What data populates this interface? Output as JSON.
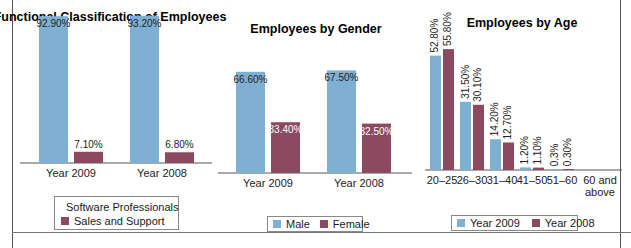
{
  "colors": {
    "series1": "#7fb0d3",
    "series2": "#8c4a61",
    "axis": "#555555"
  },
  "chart_data": [
    {
      "type": "bar",
      "title": "Functional Classification of Employees",
      "categories": [
        "Year 2009",
        "Year 2008"
      ],
      "series": [
        {
          "name": "Software Professionals",
          "values": [
            92.9,
            93.2
          ],
          "labels": [
            "92.90%",
            "93.20%"
          ]
        },
        {
          "name": "Sales and Support",
          "values": [
            7.1,
            6.8
          ],
          "labels": [
            "7.10%",
            "6.80%"
          ]
        }
      ],
      "ylim": [
        0,
        100
      ],
      "grid": false,
      "legend": "bottom"
    },
    {
      "type": "bar",
      "title": "Employees by Gender",
      "categories": [
        "Year 2009",
        "Year 2008"
      ],
      "series": [
        {
          "name": "Male",
          "values": [
            66.6,
            67.5
          ],
          "labels": [
            "66.60%",
            "67.50%"
          ]
        },
        {
          "name": "Female",
          "values": [
            33.4,
            32.5
          ],
          "labels": [
            "33.40%",
            "32.50%"
          ]
        }
      ],
      "ylim": [
        0,
        100
      ],
      "grid": false,
      "legend": "bottom"
    },
    {
      "type": "bar",
      "title": "Employees by Age",
      "categories": [
        "20–25",
        "26–30",
        "31–40",
        "41–50",
        "51–60",
        "60 and above"
      ],
      "series": [
        {
          "name": "Year 2009",
          "values": [
            52.8,
            31.5,
            14.2,
            1.2,
            0.3,
            null
          ],
          "labels": [
            "52.80%",
            "31.50%",
            "14.20%",
            "1.20%",
            "0.3%",
            ""
          ]
        },
        {
          "name": "Year 2008",
          "values": [
            55.8,
            30.1,
            12.7,
            1.1,
            0.3,
            null
          ],
          "labels": [
            "55.80%",
            "30.10%",
            "12.70%",
            "1.10%",
            "0.30%",
            ""
          ]
        }
      ],
      "ylim": [
        0,
        60
      ],
      "grid": false,
      "legend": "bottom"
    }
  ]
}
